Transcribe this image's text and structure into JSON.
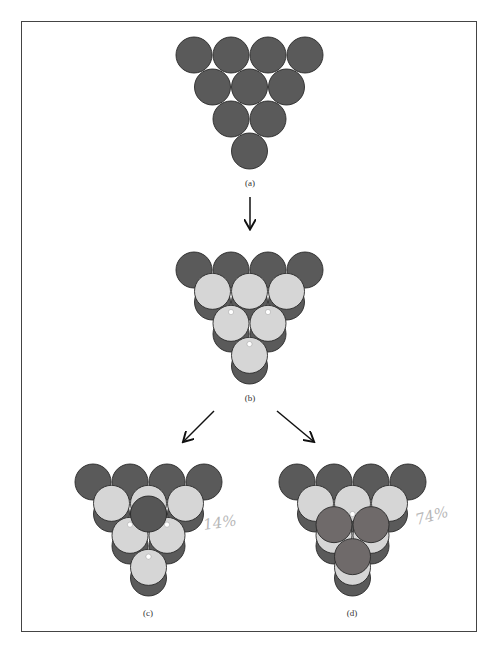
{
  "colors": {
    "bottom_layer": "#5a5a5a",
    "middle_layer": "#d6d6d6",
    "top_layer_c": "#565656",
    "top_layer_d": "#6f6a6a",
    "outline": "#2a2a2a",
    "gap": "#ffffff",
    "border": "#444444",
    "annotation": "#b8b8b8"
  },
  "figures": [
    {
      "id": "a",
      "label": "(a)",
      "description": "Single close-packed triangular layer of 10 spheres"
    },
    {
      "id": "b",
      "label": "(b)",
      "description": "Second layer (6 spheres) placed in hollows of first layer"
    },
    {
      "id": "c",
      "label": "(c)",
      "description": "Third layer placed directly over first layer (hcp / ABA)",
      "annotation": "14%"
    },
    {
      "id": "d",
      "label": "(d)",
      "description": "Third layer placed over holes of first layer (ccp / ABC)",
      "annotation": "74%"
    }
  ],
  "labels": {
    "a": "(a)",
    "b": "(b)",
    "c": "(c)",
    "d": "(d)"
  },
  "annotations": {
    "c": "14%",
    "d": "74%"
  }
}
